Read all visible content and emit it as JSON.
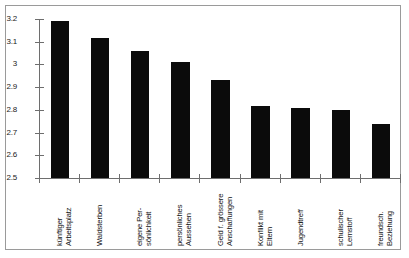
{
  "chart_data": {
    "type": "bar",
    "title": "",
    "xlabel": "",
    "ylabel": "",
    "ylim": [
      2.5,
      3.2
    ],
    "ytick_labels": [
      "3.2",
      "3.1",
      "3",
      "2.9",
      "2.8",
      "2.7",
      "2.6",
      "2.5"
    ],
    "ytick_values": [
      3.2,
      3.1,
      3.0,
      2.9,
      2.8,
      2.7,
      2.6,
      2.5
    ],
    "grid": false,
    "legend": "none",
    "bar_color": "#0b0b0b",
    "axis_color": "#6e6e6e",
    "categories": [
      "künftiger Arbeitsplatz",
      "Waldsterben",
      "eigene Per-sönlichkeit",
      "persönliches Aussehen",
      "Geld f. grössere Anschaffungen",
      "Konflikt mit Eltern",
      "Jugendtreff",
      "schulischer Lernstoff",
      "freundsch. Beziehung"
    ],
    "category_lines": [
      [
        "künftiger",
        "Arbeitsplatz"
      ],
      [
        "Waldsterben",
        ""
      ],
      [
        "eigene Per-",
        "sönlichkeit"
      ],
      [
        "persönliches",
        "Aussehen"
      ],
      [
        "Geld f. grössere",
        "Anschaffungen"
      ],
      [
        "Konflikt mit",
        "Eltern"
      ],
      [
        "Jugendtreff",
        ""
      ],
      [
        "schulischer",
        "Lernstoff"
      ],
      [
        "freundsch.",
        "Beziehung"
      ]
    ],
    "values": [
      3.19,
      3.115,
      3.06,
      3.01,
      2.93,
      2.815,
      2.81,
      2.8,
      2.74
    ]
  }
}
